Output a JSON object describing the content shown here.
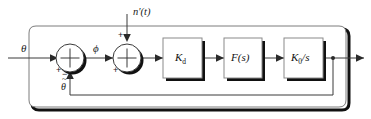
{
  "diagram": {
    "type": "control-system-block-diagram",
    "background_color": "#ffffff",
    "line_color": "#3a3a3a",
    "shadow_color": "#111111",
    "text_color": "#1a1a1a"
  },
  "signals": {
    "input": "θ",
    "error": "ϕ",
    "noise": "n′(t)",
    "feedback": "θ",
    "feedback_accent": "~"
  },
  "summers": [
    {
      "id": "summer-1",
      "input_sign_left": "+",
      "input_sign_bottom": "−"
    },
    {
      "id": "summer-2",
      "input_sign_left": "+",
      "input_sign_top": "+"
    }
  ],
  "blocks": [
    {
      "id": "block-kd",
      "label_main": "K",
      "label_sub": "d",
      "label_tail": ""
    },
    {
      "id": "block-fs",
      "label_main": "F(s)",
      "label_sub": "",
      "label_tail": ""
    },
    {
      "id": "block-k0s",
      "label_main": "K",
      "label_sub": "0",
      "label_tail": "/s"
    }
  ]
}
